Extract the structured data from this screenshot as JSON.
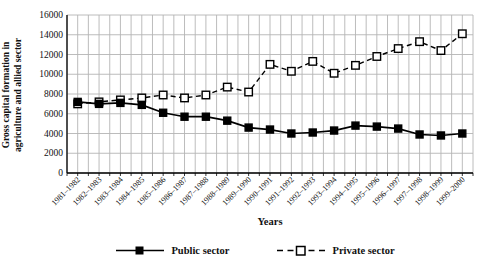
{
  "chart_data": {
    "type": "line",
    "title": "",
    "xlabel": "Years",
    "ylabel": "Gross capital formation in agriculture and allied sector",
    "ylabel_lines": [
      "Gross capital formation in",
      "agriculture and allied sector"
    ],
    "categories": [
      "1981–1982",
      "1982–1983",
      "1983–1984",
      "1984–1985",
      "1985–1986",
      "1986–1987",
      "1987–1988",
      "1988–1989",
      "1989–1990",
      "1990–1991",
      "1991–1992",
      "1992–1993",
      "1993–1994",
      "1994–1995",
      "1995–1996",
      "1996–1997",
      "1997–1998",
      "1998–1999",
      "1999–2000"
    ],
    "series": [
      {
        "name": "Public sector",
        "line": "solid",
        "marker": "filled-square",
        "color": "#000000",
        "values": [
          7200,
          7000,
          7100,
          6900,
          6100,
          5700,
          5700,
          5300,
          4600,
          4400,
          4000,
          4100,
          4300,
          4800,
          4700,
          4500,
          3900,
          3800,
          4000
        ]
      },
      {
        "name": "Private sector",
        "line": "dashed",
        "marker": "open-square",
        "color": "#000000",
        "values": [
          7000,
          7200,
          7400,
          7600,
          7900,
          7600,
          7900,
          8700,
          8200,
          11000,
          10300,
          11300,
          10100,
          10900,
          11800,
          12600,
          13300,
          12400,
          14100
        ]
      }
    ],
    "ylim": [
      0,
      16000
    ],
    "yticks": [
      0,
      2000,
      4000,
      6000,
      8000,
      10000,
      12000,
      14000,
      16000
    ],
    "grid": true,
    "legend_position": "bottom"
  },
  "colors": {
    "background": "#ffffff",
    "grid": "#b4b4b4",
    "axis": "#000000",
    "text": "#111111"
  }
}
